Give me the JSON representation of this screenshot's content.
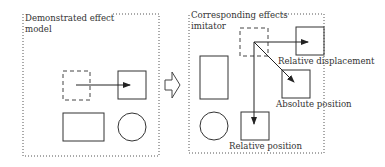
{
  "left_panel": {
    "title_line1": "Demonstrated effect",
    "title_line2": "model"
  },
  "right_panel": {
    "title_line1": "Corresponding effects",
    "title_line2": "imitator",
    "labels": {
      "relative_displacement": "Relative displacement",
      "absolute_position": "Absolute position",
      "relative_position": "Relative position"
    }
  },
  "transition_arrow": "hollow-right-arrow-icon",
  "colors": {
    "stroke": "#333333",
    "dotted_border": "#555555",
    "background": "#ffffff"
  }
}
